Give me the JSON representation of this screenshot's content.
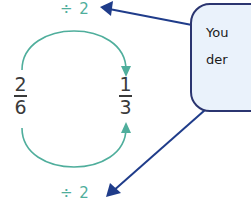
{
  "diagram": {
    "operation_top": "÷ 2",
    "operation_bottom": "÷ 2",
    "left_fraction": {
      "numerator": "2",
      "denominator": "6"
    },
    "right_fraction": {
      "numerator": "1",
      "denominator": "3"
    },
    "callout": {
      "lines": [
        "You",
        "der"
      ]
    },
    "colors": {
      "arc": "#4fae9c",
      "arrow_navy": "#1f3c8a",
      "callout_border": "#2b3570",
      "callout_fill": "#eaf2fb",
      "text": "#3a3a3a"
    }
  }
}
